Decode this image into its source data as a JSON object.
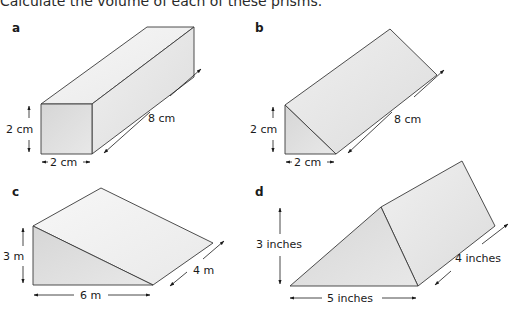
{
  "instruction": "Calculate the volume of each of these prisms.",
  "prisms": {
    "a": {
      "label": "a",
      "shape": "cuboid",
      "height": "2 cm",
      "width": "2 cm",
      "length": "8 cm"
    },
    "b": {
      "label": "b",
      "shape": "triangular prism",
      "height": "2 cm",
      "base": "2 cm",
      "length": "8 cm"
    },
    "c": {
      "label": "c",
      "shape": "triangular prism",
      "height": "3 m",
      "base": "6 m",
      "length": "4 m"
    },
    "d": {
      "label": "d",
      "shape": "triangular prism",
      "height": "3 inches",
      "base": "5 inches",
      "length": "4 inches"
    }
  },
  "colors": {
    "front_face": "#d9d9d9",
    "side_face": "#e6e6e6",
    "top_face": "#f3f3f3",
    "edge": "#3a3a3a"
  }
}
